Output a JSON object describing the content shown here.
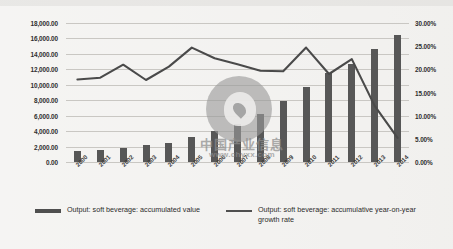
{
  "watermark": {
    "cn_text": "中国产业信息",
    "url": "www.chyxx.com",
    "logo_icon": "circle-logo-icon"
  },
  "legend": {
    "items": [
      {
        "label": "Output: soft beverage: accumulated value",
        "marker": "bar"
      },
      {
        "label": "Output: soft beverage: accumulative year-on-year growth rate",
        "marker": "line"
      }
    ]
  },
  "chart_data": {
    "type": "bar",
    "title": "",
    "xlabel": "",
    "ylabel": "",
    "grid": true,
    "legend_position": "bottom",
    "categories": [
      "2000",
      "2001",
      "2002",
      "2003",
      "2004",
      "2005",
      "2006",
      "2007",
      "2008",
      "2009",
      "2010",
      "2011",
      "2012",
      "2013",
      "2014"
    ],
    "left_axis": {
      "label": "",
      "ylim": [
        0,
        18000
      ],
      "tick_step": 2000,
      "tick_labels": [
        "18,000.00",
        "16,000.00",
        "14,000.00",
        "12,000.00",
        "10,000.00",
        "8,000.00",
        "6,000.00",
        "4,000.00",
        "2,000.00",
        "0.00"
      ]
    },
    "right_axis": {
      "label": "",
      "ylim": [
        0,
        30
      ],
      "tick_step": 5,
      "tick_labels": [
        "30.00%",
        "25.00%",
        "20.00%",
        "15.00%",
        "10.00%",
        "5.00%",
        "0.00%"
      ]
    },
    "series": [
      {
        "name": "Output: soft beverage: accumulated value",
        "type": "bar",
        "axis": "left",
        "values": [
          1400,
          1550,
          1800,
          2150,
          2450,
          3250,
          4050,
          4900,
          6250,
          7900,
          9700,
          11500,
          12750,
          14600,
          16500
        ]
      },
      {
        "name": "Output: soft beverage: accumulative year-on-year growth rate",
        "type": "line",
        "axis": "right",
        "values": [
          17.8,
          18.2,
          21.0,
          17.7,
          20.6,
          24.7,
          22.4,
          21.1,
          19.7,
          19.6,
          24.7,
          19.0,
          22.2,
          12.1,
          5.2
        ]
      }
    ]
  }
}
